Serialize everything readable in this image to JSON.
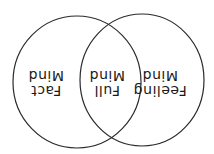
{
  "diagram": {
    "type": "venn",
    "orientation": "rotated-180",
    "stroke_color": "#2a2a2a",
    "sets": [
      {
        "id": "fact",
        "line1": "Fact",
        "line2": "Mind"
      },
      {
        "id": "feeling",
        "line1": "Feeling",
        "line2": "Mind"
      }
    ],
    "intersection": {
      "line1": "Full",
      "line2": "Mind"
    }
  }
}
